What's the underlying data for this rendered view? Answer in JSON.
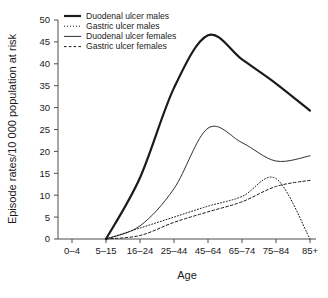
{
  "chart_data": {
    "type": "line",
    "title": "",
    "xlabel": "Age",
    "ylabel": "Episode rates/10 000 population at risk",
    "categories": [
      "0–4",
      "5–15",
      "16–24",
      "25–44",
      "45–64",
      "65–74",
      "75–84",
      "85+"
    ],
    "ylim": [
      0,
      50
    ],
    "yticks": [
      0,
      5,
      10,
      15,
      20,
      25,
      30,
      35,
      40,
      45,
      50
    ],
    "ytick_labels": [
      "0",
      "5",
      "10",
      "15",
      "20",
      "25",
      "30",
      "35",
      "40",
      "45",
      "50"
    ],
    "grid": false,
    "legend_position": "top-left",
    "series": [
      {
        "name": "Duodenal ulcer males",
        "style": "solid-thick",
        "values": [
          null,
          0.0,
          14.0,
          34.5,
          46.5,
          41.0,
          35.5,
          29.3
        ]
      },
      {
        "name": "Gastric ulcer males",
        "style": "dotted",
        "values": [
          null,
          0.0,
          2.5,
          5.0,
          7.5,
          9.7,
          13.8,
          0.0
        ]
      },
      {
        "name": "Duodenal ulcer females",
        "style": "solid-thin",
        "values": [
          null,
          0.0,
          3.0,
          11.5,
          25.3,
          22.0,
          17.8,
          19.0
        ]
      },
      {
        "name": "Gastric ulcer females",
        "style": "dashed",
        "values": [
          null,
          0.0,
          0.8,
          3.8,
          6.2,
          8.5,
          12.0,
          13.4
        ]
      }
    ],
    "colors": {
      "series_line": "#1a1a1a",
      "axis": "#4d4d4d",
      "background": "#ffffff"
    }
  }
}
